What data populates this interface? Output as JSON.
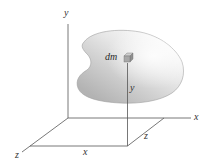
{
  "figure": {
    "colors": {
      "axis_line": "#555555",
      "body_light": "#f4f4f4",
      "body_dark": "#b9b9b9",
      "body_edge": "#9a9a9a",
      "element_cube": "#8a8a8a",
      "label": "#333333"
    }
  },
  "axes": {
    "y_axis_label": "y",
    "x_axis_label": "x",
    "z_axis_label": "z"
  },
  "body": {
    "element_label": "dm"
  },
  "dimensions": {
    "height_label": "y",
    "x_distance_label": "x",
    "z_distance_label": "z"
  }
}
